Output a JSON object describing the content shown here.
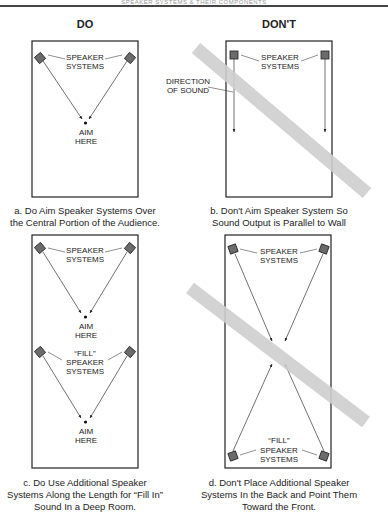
{
  "header": {
    "running_title": "SPEAKER SYSTEMS & THEIR COMPONENTS"
  },
  "columns": {
    "do_title": "DO",
    "dont_title": "DON'T"
  },
  "panels": [
    {
      "id": "a",
      "caption_line1": "a. Do Aim Speaker Systems Over",
      "caption_line2": "the Central Portion of the Audience.",
      "labels": {
        "speakers_1": "SPEAKER",
        "speakers_2": "SYSTEMS",
        "aim_1": "AIM",
        "aim_2": "HERE"
      }
    },
    {
      "id": "b",
      "caption_line1": "b. Don't Aim Speaker System So",
      "caption_line2": "Sound Output is Parallel to Wall",
      "labels": {
        "speakers_1": "SPEAKER",
        "speakers_2": "SYSTEMS",
        "direction_1": "DIRECTION",
        "direction_2": "OF SOUND"
      }
    },
    {
      "id": "c",
      "caption_line1": "c. Do Use Additional Speaker",
      "caption_line2": "Systems Along the Length for “Fill In”",
      "caption_line3": "Sound In a Deep Room.",
      "labels": {
        "speakers_1": "SPEAKER",
        "speakers_2": "SYSTEMS",
        "aim_1": "AIM",
        "aim_2": "HERE",
        "fill_1": "“FILL”",
        "fill_2": "SPEAKER",
        "fill_3": "SYSTEMS",
        "aim2_1": "AIM",
        "aim2_2": "HERE"
      }
    },
    {
      "id": "d",
      "caption_line1": "d. Don't Place Additional Speaker",
      "caption_line2": "Systems In the Back and Point Them",
      "caption_line3": "Toward the Front.",
      "labels": {
        "speakers_1": "SPEAKER",
        "speakers_2": "SYSTEMS",
        "fill_1": "“FILL”",
        "fill_2": "SPEAKER",
        "fill_3": "SYSTEMS"
      }
    }
  ],
  "colors": {
    "box_stroke": "#222222",
    "speaker_fill": "#6b6b6b",
    "strike_band": "#cfcfcf"
  }
}
